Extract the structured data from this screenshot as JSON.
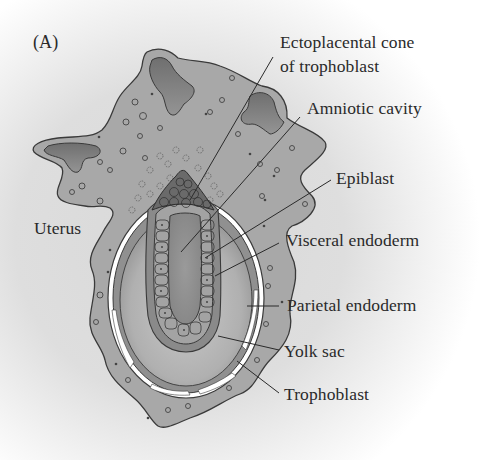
{
  "figure": {
    "panel_label": "(A)",
    "labels": {
      "ectoplacental_cone_line1": "Ectoplacental cone",
      "ectoplacental_cone_line2": "of trophoblast",
      "amniotic_cavity": "Amniotic cavity",
      "epiblast": "Epiblast",
      "uterus": "Uterus",
      "visceral_endoderm": "Visceral endoderm",
      "parietal_endoderm": "Parietal endoderm",
      "yolk_sac": "Yolk sac",
      "trophoblast": "Trophoblast"
    },
    "colors": {
      "uterus_fill": "#a9a9a9",
      "uterine_lumen_fill": "#7d7d7d",
      "yolk_sac_fill": "#b8b8b8",
      "cell_fill": "#8e8e8e",
      "outline": "#3a3a3a",
      "text": "#2a2a2a"
    }
  }
}
